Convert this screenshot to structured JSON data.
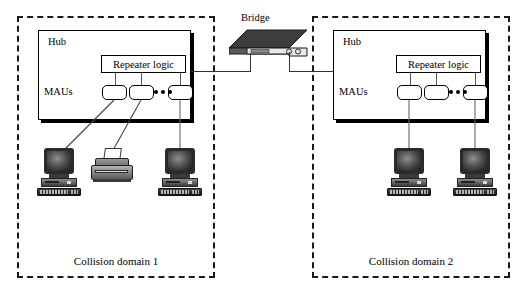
{
  "diagram": {
    "background_color": "#ffffff",
    "line_color": "#333333",
    "domains": [
      {
        "id": "left",
        "label": "Collision domain 1",
        "hub": {
          "label": "Hub",
          "repeater_label": "Repeater logic",
          "mau_label": "MAUs",
          "mau_count": 3,
          "ellipsis": "•••"
        },
        "devices": [
          {
            "type": "computer",
            "name": "workstation"
          },
          {
            "type": "printer",
            "name": "printer"
          },
          {
            "type": "computer",
            "name": "workstation"
          }
        ]
      },
      {
        "id": "right",
        "label": "Collision domain 2",
        "hub": {
          "label": "Hub",
          "repeater_label": "Repeater logic",
          "mau_label": "MAUs",
          "mau_count": 3,
          "ellipsis": "•••"
        },
        "devices": [
          {
            "type": "computer",
            "name": "workstation"
          },
          {
            "type": "computer",
            "name": "workstation"
          }
        ]
      }
    ],
    "bridge": {
      "label": "Bridge",
      "top_color": "#3a3a3a",
      "front_color": "#e8e8e8",
      "led_count": 2
    }
  }
}
